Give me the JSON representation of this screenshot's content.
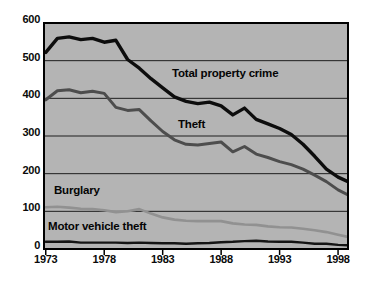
{
  "chart_data": {
    "type": "line",
    "title": "",
    "xlabel": "",
    "ylabel": "",
    "ylim": [
      0,
      600
    ],
    "xlim": [
      1973,
      1999
    ],
    "grid": "horizontal",
    "legend": "inline-labels",
    "plot_bg": "#b4b4b4",
    "colors": {
      "grid": "#1f1f1f",
      "border": "#000000",
      "tick_text": "#0a0a0a"
    },
    "x": [
      1973,
      1974,
      1975,
      1976,
      1977,
      1978,
      1979,
      1980,
      1981,
      1982,
      1983,
      1984,
      1985,
      1986,
      1987,
      1988,
      1989,
      1990,
      1991,
      1992,
      1993,
      1994,
      1995,
      1996,
      1997,
      1998,
      1999
    ],
    "series": [
      {
        "name": "Total property crime",
        "color": "#0d0d0d",
        "stroke_width": 3.4,
        "values": [
          522,
          559,
          563,
          556,
          559,
          549,
          554,
          503,
          480,
          452,
          428,
          404,
          392,
          386,
          390,
          380,
          356,
          374,
          344,
          332,
          320,
          304,
          278,
          246,
          212,
          191,
          179
        ]
      },
      {
        "name": "Theft",
        "color": "#4d4d4d",
        "stroke_width": 3,
        "values": [
          396,
          420,
          423,
          415,
          419,
          413,
          376,
          368,
          370,
          340,
          312,
          290,
          278,
          276,
          280,
          284,
          258,
          272,
          252,
          243,
          232,
          224,
          212,
          196,
          179,
          157,
          144
        ]
      },
      {
        "name": "Burglary",
        "color": "#919191",
        "stroke_width": 2.6,
        "values": [
          111,
          112,
          110,
          107,
          106,
          103,
          98,
          100,
          106,
          94,
          84,
          78,
          75,
          74,
          74,
          74,
          68,
          65,
          64,
          60,
          58,
          57,
          54,
          50,
          45,
          38,
          32
        ]
      },
      {
        "name": "Motor vehicle theft",
        "color": "#141414",
        "stroke_width": 2.4,
        "values": [
          19,
          19,
          20,
          17,
          17,
          17,
          17,
          16,
          17,
          16,
          15,
          15,
          14,
          15,
          16,
          18,
          19,
          21,
          22,
          20,
          19,
          19,
          17,
          14,
          14,
          11,
          10
        ]
      }
    ],
    "y_ticks": [
      600,
      500,
      400,
      300,
      200,
      100,
      0
    ],
    "x_ticks": [
      1973,
      1978,
      1983,
      1988,
      1993,
      1998
    ]
  }
}
